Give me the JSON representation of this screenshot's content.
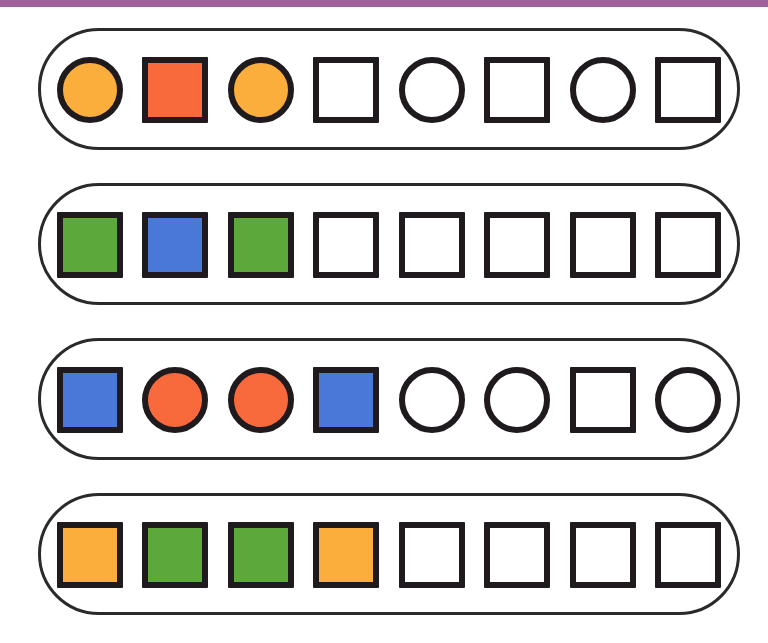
{
  "header_bar": {
    "color": "#a0609a"
  },
  "colors": {
    "orange": "#fbae3c",
    "red": "#f86a3c",
    "green": "#5ca83a",
    "blue": "#4a78d8",
    "empty": "#ffffff",
    "outline": "#1e1a1e"
  },
  "rows": [
    {
      "cells": [
        {
          "shape": "circle",
          "fill": "orange"
        },
        {
          "shape": "square",
          "fill": "red"
        },
        {
          "shape": "circle",
          "fill": "orange"
        },
        {
          "shape": "square",
          "fill": "empty"
        },
        {
          "shape": "circle",
          "fill": "empty"
        },
        {
          "shape": "square",
          "fill": "empty"
        },
        {
          "shape": "circle",
          "fill": "empty"
        },
        {
          "shape": "square",
          "fill": "empty"
        }
      ]
    },
    {
      "cells": [
        {
          "shape": "square",
          "fill": "green"
        },
        {
          "shape": "square",
          "fill": "blue"
        },
        {
          "shape": "square",
          "fill": "green"
        },
        {
          "shape": "square",
          "fill": "empty"
        },
        {
          "shape": "square",
          "fill": "empty"
        },
        {
          "shape": "square",
          "fill": "empty"
        },
        {
          "shape": "square",
          "fill": "empty"
        },
        {
          "shape": "square",
          "fill": "empty"
        }
      ]
    },
    {
      "cells": [
        {
          "shape": "square",
          "fill": "blue"
        },
        {
          "shape": "circle",
          "fill": "red"
        },
        {
          "shape": "circle",
          "fill": "red"
        },
        {
          "shape": "square",
          "fill": "blue"
        },
        {
          "shape": "circle",
          "fill": "empty"
        },
        {
          "shape": "circle",
          "fill": "empty"
        },
        {
          "shape": "square",
          "fill": "empty"
        },
        {
          "shape": "circle",
          "fill": "empty"
        }
      ]
    },
    {
      "cells": [
        {
          "shape": "square",
          "fill": "orange"
        },
        {
          "shape": "square",
          "fill": "green"
        },
        {
          "shape": "square",
          "fill": "green"
        },
        {
          "shape": "square",
          "fill": "orange"
        },
        {
          "shape": "square",
          "fill": "empty"
        },
        {
          "shape": "square",
          "fill": "empty"
        },
        {
          "shape": "square",
          "fill": "empty"
        },
        {
          "shape": "square",
          "fill": "empty"
        }
      ]
    }
  ]
}
